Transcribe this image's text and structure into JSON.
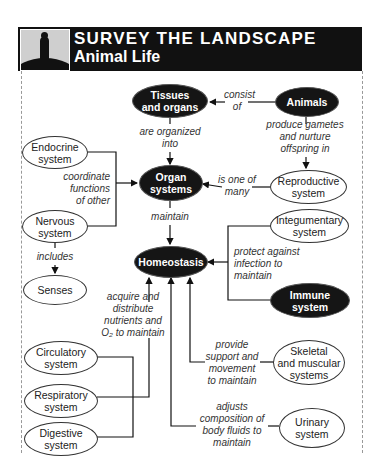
{
  "header": {
    "title": "SURVEY THE LANDSCAPE",
    "subtitle": "Animal Life",
    "logo_icon": "person-on-hill-icon"
  },
  "nodes": {
    "tissues": {
      "line1": "Tissues",
      "line2": "and organs"
    },
    "animals": {
      "line1": "Animals"
    },
    "endocrine": {
      "line1": "Endocrine",
      "line2": "system"
    },
    "organ_systems": {
      "line1": "Organ",
      "line2": "systems"
    },
    "reproductive": {
      "line1": "Reproductive",
      "line2": "system"
    },
    "nervous": {
      "line1": "Nervous",
      "line2": "system"
    },
    "integumentary": {
      "line1": "Integumentary",
      "line2": "system"
    },
    "homeostasis": {
      "line1": "Homeostasis"
    },
    "senses": {
      "line1": "Senses"
    },
    "immune": {
      "line1": "Immune",
      "line2": "system"
    },
    "circulatory": {
      "line1": "Circulatory",
      "line2": "system"
    },
    "skeletal": {
      "line1": "Skeletal",
      "line2": "and muscular",
      "line3": "systems"
    },
    "respiratory": {
      "line1": "Respiratory",
      "line2": "system"
    },
    "digestive": {
      "line1": "Digestive",
      "line2": "system"
    },
    "urinary": {
      "line1": "Urinary",
      "line2": "system"
    }
  },
  "links": {
    "consist_of": {
      "line1": "consist",
      "line2": "of"
    },
    "produce_gametes": {
      "line1": "produce gametes",
      "line2": "and nurture",
      "line3": "offspring in"
    },
    "organized_into": {
      "line1": "are organized",
      "line2": "into"
    },
    "coordinate": {
      "line1": "coordinate",
      "line2": "functions",
      "line3": "of other"
    },
    "one_of_many": {
      "line1": "is one of",
      "line2": "many"
    },
    "maintain": {
      "line1": "maintain"
    },
    "includes": {
      "line1": "includes"
    },
    "protect": {
      "line1": "protect against",
      "line2": "infection to",
      "line3": "maintain"
    },
    "acquire": {
      "line1": "acquire and",
      "line2": "distribute",
      "line3": "nutrients and",
      "line4": "O₂ to maintain"
    },
    "provide_support": {
      "line1": "provide",
      "line2": "support and",
      "line3": "movement",
      "line4": "to maintain"
    },
    "adjusts": {
      "line1": "adjusts",
      "line2": "composition of",
      "line3": "body fluids to",
      "line4": "maintain"
    }
  }
}
